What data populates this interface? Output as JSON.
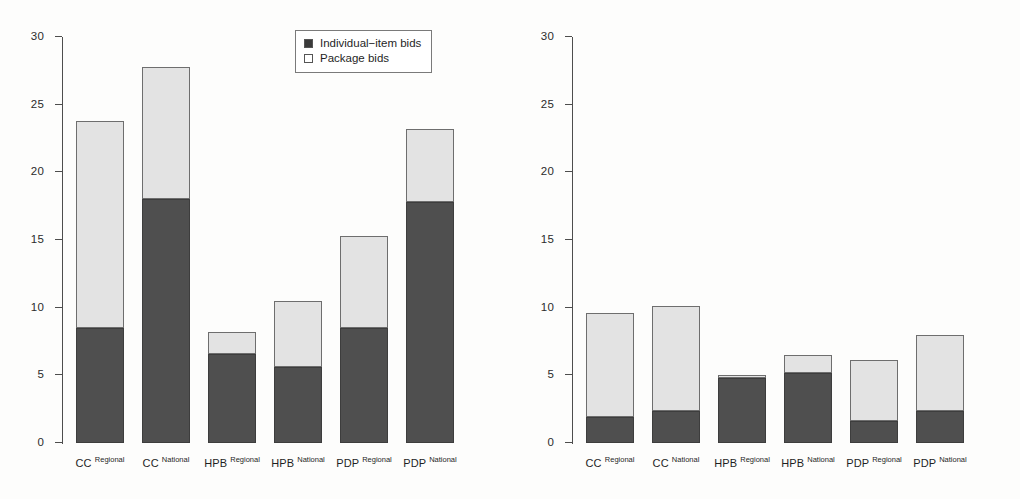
{
  "chart_data": [
    {
      "type": "bar",
      "panel": "left",
      "stacked": true,
      "title": "",
      "xlabel": "",
      "ylabel": "",
      "ylim": [
        0,
        30
      ],
      "yticks": [
        0,
        5,
        10,
        15,
        20,
        25,
        30
      ],
      "ytick_labels": [
        "0",
        "5",
        "10",
        "15",
        "20",
        "25",
        "30"
      ],
      "grid": false,
      "legend_position": "top-right",
      "categories": [
        {
          "base": "CC",
          "sup": "Regional"
        },
        {
          "base": "CC",
          "sup": "National"
        },
        {
          "base": "HPB",
          "sup": "Regional"
        },
        {
          "base": "HPB",
          "sup": "National"
        },
        {
          "base": "PDP",
          "sup": "Regional"
        },
        {
          "base": "PDP",
          "sup": "National"
        }
      ],
      "series": [
        {
          "name": "Individual-item bids",
          "color": "#4f4f4f",
          "values": [
            8.5,
            18.0,
            6.6,
            5.6,
            8.5,
            17.8
          ]
        },
        {
          "name": "Package bids",
          "color": "#e3e3e3",
          "values": [
            15.3,
            9.8,
            1.6,
            4.9,
            6.8,
            5.4
          ]
        }
      ],
      "totals": [
        23.8,
        27.8,
        8.2,
        10.5,
        15.3,
        23.2
      ]
    },
    {
      "type": "bar",
      "panel": "right",
      "stacked": true,
      "title": "",
      "xlabel": "",
      "ylabel": "",
      "ylim": [
        0,
        30
      ],
      "yticks": [
        0,
        5,
        10,
        15,
        20,
        25,
        30
      ],
      "ytick_labels": [
        "0",
        "5",
        "10",
        "15",
        "20",
        "25",
        "30"
      ],
      "grid": false,
      "legend_position": "top-right",
      "categories": [
        {
          "base": "CC",
          "sup": "Regional"
        },
        {
          "base": "CC",
          "sup": "National"
        },
        {
          "base": "HPB",
          "sup": "Regional"
        },
        {
          "base": "HPB",
          "sup": "National"
        },
        {
          "base": "PDP",
          "sup": "Regional"
        },
        {
          "base": "PDP",
          "sup": "National"
        }
      ],
      "series": [
        {
          "name": "Individual-item bids",
          "color": "#4f4f4f",
          "values": [
            1.9,
            2.4,
            4.8,
            5.2,
            1.6,
            2.4
          ]
        },
        {
          "name": "Package bids",
          "color": "#e3e3e3",
          "values": [
            7.7,
            7.7,
            0.2,
            1.3,
            4.5,
            5.6
          ]
        }
      ],
      "totals": [
        9.6,
        10.1,
        5.0,
        6.5,
        6.1,
        8.0
      ]
    }
  ],
  "legend": {
    "individual_label": "Individual−item bids",
    "package_label": "Package bids",
    "individual_color": "#3a3a3a",
    "package_color": "#ffffff"
  },
  "axis": {
    "tick_labels": [
      "30",
      "25",
      "20",
      "15",
      "10",
      "5",
      "0"
    ],
    "tick_values": [
      30,
      25,
      20,
      15,
      10,
      5,
      0
    ]
  }
}
